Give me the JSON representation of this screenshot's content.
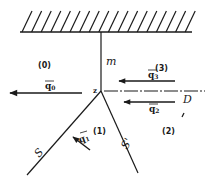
{
  "figure": {
    "wall": {
      "label": ""
    },
    "lines": {
      "mach_stem": {
        "label": "m"
      },
      "slip_line": {
        "label": "D",
        "style": "dash-dot"
      },
      "incident_shock": {
        "label": "S"
      },
      "reflected_shock": {
        "label": "S'"
      }
    },
    "node": {
      "label": "z"
    },
    "regions": [
      {
        "id": "0",
        "label": "(0)"
      },
      {
        "id": "1",
        "label": "(1)"
      },
      {
        "id": "2",
        "label": "(2)"
      },
      {
        "id": "3",
        "label": "(3)"
      }
    ],
    "velocities": [
      {
        "id": "q0",
        "base": "q",
        "sub": "0"
      },
      {
        "id": "q1",
        "base": "q",
        "sub": "1"
      },
      {
        "id": "q2",
        "base": "q",
        "sub": "2"
      },
      {
        "id": "q3",
        "base": "q",
        "sub": "3"
      }
    ],
    "colors": {
      "ink": "#1a1a1a",
      "background": "#ffffff"
    }
  }
}
